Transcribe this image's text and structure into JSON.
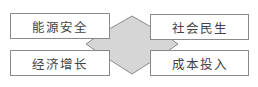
{
  "diagram": {
    "center_shape": {
      "type": "hexagon-diamond",
      "fill": "#d6d6d6",
      "stroke": "#8a8a8a"
    },
    "boxes": [
      {
        "position": "top-left",
        "label": "能源安全"
      },
      {
        "position": "top-right",
        "label": "社会民生"
      },
      {
        "position": "bottom-left",
        "label": "经济增长"
      },
      {
        "position": "bottom-right",
        "label": "成本投入"
      }
    ]
  }
}
